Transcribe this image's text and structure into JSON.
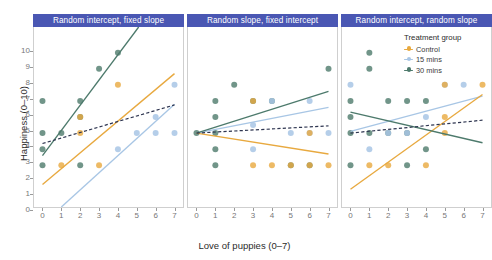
{
  "chart_data": {
    "type": "scatter",
    "title": "",
    "xlabel": "Love of puppies (0–7)",
    "ylabel": "Happiness (0–10)",
    "xlim": [
      -0.45,
      7.45
    ],
    "ylim": [
      -0.6,
      10.6
    ],
    "xticks": [
      0,
      1,
      2,
      3,
      4,
      5,
      6,
      7
    ],
    "yticks": [
      0,
      1,
      2,
      3,
      4,
      5,
      6,
      7,
      8,
      9,
      10
    ],
    "grid": false,
    "legend_position": "top-right (panel 3)",
    "legend_title": "Treatment group",
    "colors": {
      "control": "#e8a93f",
      "mins15": "#a8c6e5",
      "mins30": "#4d7a6c",
      "overall": "#2e3550",
      "panel_header": "#4a57b3",
      "panel_header_text": "#ffffff",
      "axis_text": "#777777",
      "panel_border": "#cfcfcf",
      "background": "#ffffff"
    },
    "series": [
      {
        "name": "Control",
        "key": "control",
        "color": "#e8a93f"
      },
      {
        "name": "15 mins",
        "key": "mins15",
        "color": "#a8c6e5"
      },
      {
        "name": "30 mins",
        "key": "mins30",
        "color": "#4d7a6c"
      }
    ],
    "panels": [
      {
        "title": "Random intercept, fixed slope",
        "points": {
          "control": [
            [
              1,
              2
            ],
            [
              2,
              4
            ],
            [
              2,
              5
            ],
            [
              3,
              2
            ],
            [
              4,
              7
            ]
          ],
          "mins15": [
            [
              4,
              3
            ],
            [
              5,
              4
            ],
            [
              6,
              4
            ],
            [
              6,
              5
            ],
            [
              7,
              4
            ],
            [
              7,
              7
            ]
          ],
          "mins30": [
            [
              0,
              2
            ],
            [
              0,
              3
            ],
            [
              0,
              4
            ],
            [
              0,
              6
            ],
            [
              1,
              4
            ],
            [
              2,
              2
            ],
            [
              2,
              5
            ],
            [
              2,
              6
            ],
            [
              3,
              8
            ],
            [
              4,
              9
            ]
          ]
        },
        "lines": {
          "control": {
            "x0": 0,
            "y0": 0.8,
            "x1": 7,
            "y1": 7.7
          },
          "mins15": {
            "x0": 1,
            "y0": -0.6,
            "x1": 7,
            "y1": 5.8
          },
          "mins30": {
            "x0": 0,
            "y0": 2.6,
            "x1": 5.1,
            "y1": 10.6
          },
          "overall": {
            "x0": 0,
            "y0": 3.35,
            "x1": 7,
            "y1": 5.75,
            "dashed": true
          }
        }
      },
      {
        "title": "Random slope, fixed intercept",
        "points": {
          "control": [
            [
              3,
              6
            ],
            [
              3,
              2
            ],
            [
              4,
              2
            ],
            [
              5,
              2
            ],
            [
              6,
              4
            ],
            [
              6,
              2
            ],
            [
              7,
              2
            ]
          ],
          "mins15": [
            [
              3,
              4.5
            ],
            [
              4,
              6
            ],
            [
              5,
              4
            ],
            [
              6,
              6
            ],
            [
              6,
              4
            ],
            [
              7,
              4
            ],
            [
              3,
              3
            ]
          ],
          "mins30": [
            [
              0,
              4
            ],
            [
              1,
              4
            ],
            [
              1,
              6
            ],
            [
              1,
              5
            ],
            [
              1,
              3
            ],
            [
              1,
              2
            ],
            [
              2,
              7
            ],
            [
              3,
              6
            ],
            [
              4,
              6
            ],
            [
              5,
              2
            ],
            [
              6,
              2
            ],
            [
              7,
              8
            ]
          ]
        },
        "lines": {
          "control": {
            "x0": 0,
            "y0": 4.0,
            "x1": 7,
            "y1": 2.7
          },
          "mins15": {
            "x0": 0,
            "y0": 4.0,
            "x1": 7,
            "y1": 5.6
          },
          "mins30": {
            "x0": 0,
            "y0": 4.0,
            "x1": 7,
            "y1": 6.6
          },
          "overall": {
            "x0": 0,
            "y0": 4.0,
            "x1": 7,
            "y1": 4.45,
            "dashed": true
          }
        }
      },
      {
        "title": "Random intercept, random slope",
        "points": {
          "control": [
            [
              1,
              2
            ],
            [
              2,
              2
            ],
            [
              4,
              2
            ],
            [
              5,
              4
            ],
            [
              5,
              5
            ],
            [
              5,
              7
            ],
            [
              7,
              7
            ]
          ],
          "mins15": [
            [
              0,
              7
            ],
            [
              1,
              3
            ],
            [
              2,
              4
            ],
            [
              3,
              4
            ],
            [
              4,
              5
            ],
            [
              5,
              7
            ],
            [
              6,
              7
            ]
          ],
          "mins30": [
            [
              0,
              2
            ],
            [
              0,
              4
            ],
            [
              0,
              5
            ],
            [
              0,
              6
            ],
            [
              1,
              4
            ],
            [
              1,
              9
            ],
            [
              1,
              8
            ],
            [
              2,
              4
            ],
            [
              2,
              6
            ],
            [
              3,
              2
            ],
            [
              3,
              4
            ],
            [
              3,
              6
            ],
            [
              4,
              3
            ],
            [
              4,
              6
            ]
          ]
        },
        "lines": {
          "control": {
            "x0": 0,
            "y0": 0.5,
            "x1": 7,
            "y1": 6.4
          },
          "mins15": {
            "x0": 0,
            "y0": 4.1,
            "x1": 7,
            "y1": 6.3
          },
          "mins30": {
            "x0": 0,
            "y0": 5.3,
            "x1": 7,
            "y1": 3.4
          },
          "overall": {
            "x0": 0,
            "y0": 4.0,
            "x1": 7,
            "y1": 4.8,
            "dashed": true
          }
        }
      }
    ]
  }
}
